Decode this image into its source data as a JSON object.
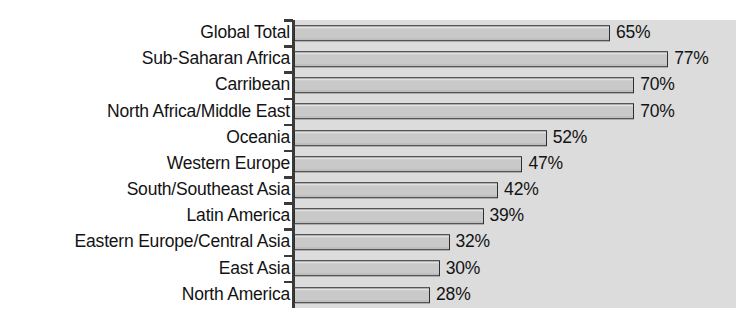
{
  "chart_data": {
    "type": "bar",
    "orientation": "horizontal",
    "title": "",
    "subtitle": "",
    "xlabel": "",
    "ylabel": "",
    "xlim": [
      0,
      91
    ],
    "grid": false,
    "legend": null,
    "value_suffix": "%",
    "categories": [
      "Global Total",
      "Sub-Saharan Africa",
      "Carribean",
      "North Africa/Middle East",
      "Oceania",
      "Western Europe",
      "South/Southeast Asia",
      "Latin America",
      "Eastern Europe/Central Asia",
      "East Asia",
      "North America"
    ],
    "values": [
      65,
      77,
      70,
      70,
      52,
      47,
      42,
      39,
      32,
      30,
      28
    ],
    "value_labels": [
      "65%",
      "77%",
      "70%",
      "70%",
      "52%",
      "47%",
      "42%",
      "39%",
      "32%",
      "30%",
      "28%"
    ],
    "colors": {
      "bar_fill": "#c9c9c9",
      "bar_border": "#2e2e2e",
      "plot_background": "#dcdcdc",
      "page_background": "#ffffff",
      "axis": "#3a3a3a",
      "text": "#131313"
    }
  }
}
